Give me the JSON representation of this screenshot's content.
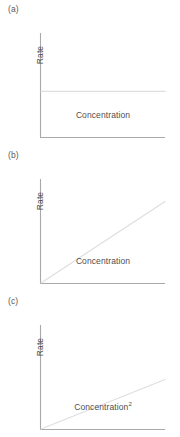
{
  "figure": {
    "panels": [
      {
        "label": "(a)",
        "ylabel": "Rate",
        "xlabel": "Concentration",
        "xlabel_sup": ""
      },
      {
        "label": "(b)",
        "ylabel": "Rate",
        "xlabel": "Concentration",
        "xlabel_sup": ""
      },
      {
        "label": "(c)",
        "ylabel": "Rate",
        "xlabel": "Concentration",
        "xlabel_sup": "2"
      }
    ]
  },
  "colors": {
    "axis": "#a9a9ab",
    "data_line": "#dedede",
    "text": "#4e4e50",
    "panel_label": "#58585a",
    "background": "#ffffff"
  },
  "chart_data": [
    {
      "type": "line",
      "title": "(a)",
      "xlabel": "Concentration",
      "ylabel": "Rate",
      "xlim": [
        0,
        1
      ],
      "ylim": [
        0,
        1
      ],
      "grid": false,
      "legend": "none",
      "series": [
        {
          "name": "zero-order rate",
          "x": [
            0,
            1
          ],
          "values": [
            0.47,
            0.47
          ]
        }
      ]
    },
    {
      "type": "line",
      "title": "(b)",
      "xlabel": "Concentration",
      "ylabel": "Rate",
      "xlim": [
        0,
        1
      ],
      "ylim": [
        0,
        1
      ],
      "grid": false,
      "legend": "none",
      "series": [
        {
          "name": "first-order rate",
          "x": [
            0,
            1
          ],
          "values": [
            0.0,
            0.84
          ]
        }
      ]
    },
    {
      "type": "line",
      "title": "(c)",
      "xlabel": "Concentration²",
      "ylabel": "Rate",
      "xlim": [
        0,
        1
      ],
      "ylim": [
        0,
        1
      ],
      "grid": false,
      "legend": "none",
      "series": [
        {
          "name": "second-order rate",
          "x": [
            0,
            1
          ],
          "values": [
            0.0,
            0.51
          ]
        }
      ]
    }
  ]
}
